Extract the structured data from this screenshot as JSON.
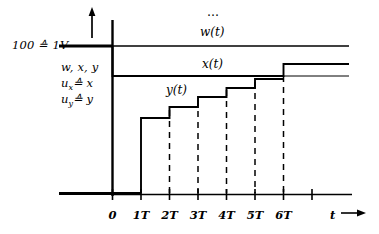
{
  "figure": {
    "kind": "control-system-timing-diagram",
    "ink_color": "#000000",
    "background": "#ffffff"
  },
  "axis_labels": {
    "scale_note": "100 ≙ 1V",
    "ordinate_quantities": "w, x, y",
    "ordinate_ux": "u",
    "ordinate_ux_sub": "x",
    "ordinate_ux_rel": "≙ x",
    "ordinate_uy": "u",
    "ordinate_uy_sub": "y",
    "ordinate_uy_rel": "≙ y",
    "time_axis": "t",
    "time_axis_arrow": "→",
    "continuation_dots": "…"
  },
  "curve_labels": {
    "w": "w(t)",
    "x": "x(t)",
    "y": "y(t)"
  },
  "chart_data": {
    "type": "line",
    "title": "",
    "xlabel": "t",
    "ylabel": "w, x, y",
    "grid": false,
    "legend": "inline-curve-labels",
    "x_tick_labels": [
      "0",
      "1T",
      "2T",
      "3T",
      "4T",
      "5T",
      "6T"
    ],
    "x_tick_values": [
      0,
      1,
      2,
      3,
      4,
      5,
      6
    ],
    "xlim": [
      -0.6,
      7.2
    ],
    "ylim": [
      0,
      110
    ],
    "y_reference_levels": {
      "w_level": 100,
      "x_settled_level": 78,
      "x_final_level": 88,
      "zero_level": 0
    },
    "series": [
      {
        "name": "w(t)",
        "style": "step-constant",
        "description": "reference value, constant at 100 for t >= 0",
        "points": [
          {
            "t": -0.55,
            "v": 100
          },
          {
            "t": 7.05,
            "v": 100
          }
        ]
      },
      {
        "name": "x(t)",
        "style": "step",
        "description": "controlled variable: drops from 100 to 78 at t=0, steps up to 88 at t=6T",
        "points": [
          {
            "t": -0.55,
            "v": 100
          },
          {
            "t": 0,
            "v": 100
          },
          {
            "t": 0,
            "v": 78
          },
          {
            "t": 6,
            "v": 78
          },
          {
            "t": 6,
            "v": 88
          },
          {
            "t": 7.05,
            "v": 88
          }
        ]
      },
      {
        "name": "y(t)",
        "style": "staircase-sample-and-hold",
        "description": "manipulated variable held constant over each sampling period T",
        "points": [
          {
            "t": -0.55,
            "v": 0
          },
          {
            "t": 1,
            "v": 0
          },
          {
            "t": 1,
            "v": 44
          },
          {
            "t": 2,
            "v": 44
          },
          {
            "t": 2,
            "v": 55
          },
          {
            "t": 3,
            "v": 55
          },
          {
            "t": 3,
            "v": 64
          },
          {
            "t": 4,
            "v": 64
          },
          {
            "t": 4,
            "v": 72
          },
          {
            "t": 5,
            "v": 72
          },
          {
            "t": 5,
            "v": 78
          }
        ]
      }
    ],
    "dashed_droplines_at": [
      2,
      3,
      4,
      5,
      6
    ],
    "annotations": [
      {
        "text": "100 ≙ 1V",
        "kind": "ordinate-scale-note"
      },
      {
        "text": "…",
        "kind": "continuation-dots"
      }
    ]
  }
}
